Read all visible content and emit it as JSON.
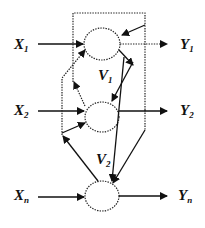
{
  "diagram": {
    "type": "recurrent neural network schematic",
    "inputs": [
      {
        "label": "X",
        "sub": "1"
      },
      {
        "label": "X",
        "sub": "2"
      },
      {
        "label": "X",
        "sub": "n"
      }
    ],
    "outputs": [
      {
        "label": "Y",
        "sub": "1"
      },
      {
        "label": "Y",
        "sub": "2"
      },
      {
        "label": "Y",
        "sub": "n"
      }
    ],
    "weights": [
      {
        "label": "V",
        "sub": "1"
      },
      {
        "label": "V",
        "sub": "2"
      }
    ],
    "nodes": [
      "node-1",
      "node-2",
      "node-n"
    ],
    "colors": {
      "stroke": "#111111",
      "background": "#ffffff"
    }
  }
}
